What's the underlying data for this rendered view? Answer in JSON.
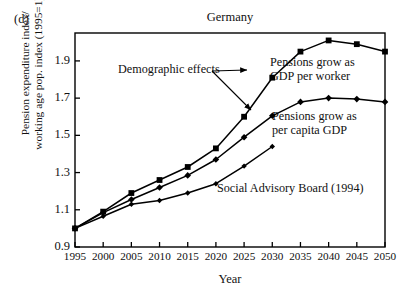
{
  "panel_label": "(d)",
  "chart_data": {
    "type": "line",
    "title": "Germany",
    "xlabel": "Year",
    "ylabel_line1": "Pension expenditure index/",
    "ylabel_line2": "working age pop. index (1995=1)",
    "grid": false,
    "legend_position": "inline-annotations",
    "x": [
      1995,
      2000,
      2005,
      2010,
      2015,
      2020,
      2025,
      2030,
      2035,
      2040,
      2045,
      2050
    ],
    "xlim": [
      1995,
      2050
    ],
    "xticks": [
      1995,
      2000,
      2005,
      2010,
      2015,
      2020,
      2025,
      2030,
      2035,
      2040,
      2045,
      2050
    ],
    "xtick_labels": [
      "1995",
      "2000",
      "2005",
      "2010",
      "2015",
      "2020",
      "2025",
      "2030",
      "2035",
      "2040",
      "2045",
      "2050"
    ],
    "ylim": [
      0.9,
      2.05
    ],
    "yticks": [
      0.9,
      1.1,
      1.3,
      1.5,
      1.7,
      1.9
    ],
    "ytick_labels": [
      "0.9",
      "1.1",
      "1.3",
      "1.5",
      "1.7",
      "1.9"
    ],
    "series": [
      {
        "name": "Pensions grow as GDP per worker",
        "marker": "square",
        "values": [
          1.0,
          1.09,
          1.19,
          1.26,
          1.33,
          1.43,
          1.6,
          1.81,
          1.95,
          2.01,
          1.99,
          1.95
        ]
      },
      {
        "name": "Pensions grow as per capita GDP",
        "marker": "diamond",
        "values": [
          1.0,
          1.085,
          1.155,
          1.22,
          1.285,
          1.37,
          1.49,
          1.605,
          1.68,
          1.7,
          1.695,
          1.68
        ]
      },
      {
        "name": "Social Advisory Board (1994)",
        "marker": "diamond-small",
        "values": [
          1.0,
          1.065,
          1.13,
          1.15,
          1.19,
          1.24,
          1.335,
          1.44,
          null,
          null,
          null,
          null
        ]
      }
    ],
    "annotations": [
      {
        "id": "demographic-effects",
        "text": "Demographic effects",
        "x": 118,
        "y": 63,
        "arrows": [
          {
            "from_x": 212,
            "from_y": 71,
            "to_x": 247,
            "to_y": 70
          },
          {
            "from_x": 212,
            "from_y": 71,
            "to_x": 251,
            "to_y": 110
          }
        ]
      },
      {
        "id": "gdp-per-worker-label",
        "line1": "Pensions grow as",
        "line2": "GDP per worker",
        "x": 270,
        "y": 56
      },
      {
        "id": "per-capita-gdp-label",
        "line1": "Pensions grow as",
        "line2": "per capita GDP",
        "x": 272,
        "y": 110
      },
      {
        "id": "social-advisory-board-label",
        "text": "Social Advisory Board (1994)",
        "x": 217,
        "y": 182
      }
    ],
    "colors": {
      "line": "#000000",
      "marker": "#000000",
      "axis": "#000000",
      "background": "#ffffff"
    }
  }
}
